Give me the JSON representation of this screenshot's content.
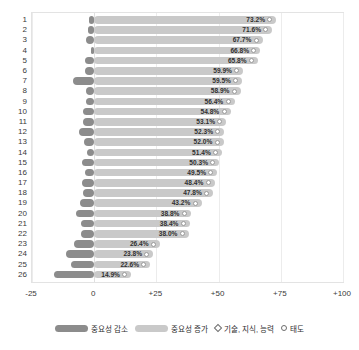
{
  "chart_data": {
    "type": "bar",
    "title": "",
    "subtitle": "",
    "xlabel": "",
    "ylabel": "",
    "orientation": "horizontal",
    "stacked": "diverging",
    "xlim": [
      -25,
      100
    ],
    "xticks": [
      -25,
      0,
      25,
      50,
      75,
      100
    ],
    "xtick_labels": [
      "-25",
      "0",
      "+25",
      "+50",
      "+75",
      "+100"
    ],
    "grid": true,
    "legend_position": "bottom",
    "categories": [
      "1",
      "2",
      "3",
      "4",
      "5",
      "6",
      "7",
      "8",
      "9",
      "10",
      "11",
      "12",
      "13",
      "14",
      "15",
      "16",
      "17",
      "18",
      "19",
      "20",
      "21",
      "22",
      "23",
      "24",
      "25",
      "26"
    ],
    "series": [
      {
        "name": "중요성 감소",
        "color": "#8c8c8c",
        "values": [
          -1.9,
          -2.6,
          -3.1,
          -1.4,
          -3.5,
          -3.8,
          -8.6,
          -3.2,
          -3.4,
          -4.4,
          -4.6,
          -6.1,
          -4.2,
          -2.7,
          -5.1,
          -3.6,
          -5.0,
          -4.4,
          -5.6,
          -7.3,
          -5.2,
          -5.3,
          -8.0,
          -11.2,
          -9.3,
          -16.1
        ]
      },
      {
        "name": "중요성 증가",
        "color": "#c9c9c9",
        "values": [
          73.2,
          71.6,
          67.7,
          66.8,
          65.8,
          59.9,
          59.5,
          58.9,
          56.4,
          54.8,
          53.1,
          52.3,
          52.0,
          51.4,
          50.3,
          49.5,
          48.4,
          47.8,
          43.2,
          38.8,
          38.4,
          38.0,
          26.4,
          23.8,
          22.6,
          14.9
        ]
      }
    ],
    "data_labels": [
      "73.2%",
      "71.6%",
      "67.7%",
      "66.8%",
      "65.8%",
      "59.9%",
      "59.5%",
      "58.9%",
      "56.4%",
      "54.8%",
      "53.1%",
      "52.3%",
      "52.0%",
      "51.4%",
      "50.3%",
      "49.5%",
      "48.4%",
      "47.8%",
      "43.2%",
      "38.8%",
      "38.4%",
      "38.0%",
      "26.4%",
      "23.8%",
      "22.6%",
      "14.9%"
    ],
    "markers": [
      "circle",
      "circle",
      "circle",
      "circle",
      "circle",
      "circle",
      "circle",
      "circle",
      "circle",
      "circle",
      "circle",
      "circle",
      "circle",
      "circle",
      "circle",
      "circle",
      "circle",
      "circle",
      "circle",
      "circle",
      "circle",
      "circle",
      "circle",
      "circle",
      "circle",
      "circle"
    ]
  },
  "legend": {
    "items": [
      {
        "label": "중요성 감소",
        "type": "swatch-dark"
      },
      {
        "label": "중요성 증가",
        "type": "swatch-light"
      },
      {
        "label": "기술, 지식, 능력",
        "type": "glyph-diamond"
      },
      {
        "label": "태도",
        "type": "glyph-circle"
      }
    ]
  },
  "colors": {
    "decrease": "#8c8c8c",
    "increase": "#c9c9c9",
    "grid": "#ececec",
    "frame": "#e3e3e3",
    "text": "#2f2f2f"
  }
}
